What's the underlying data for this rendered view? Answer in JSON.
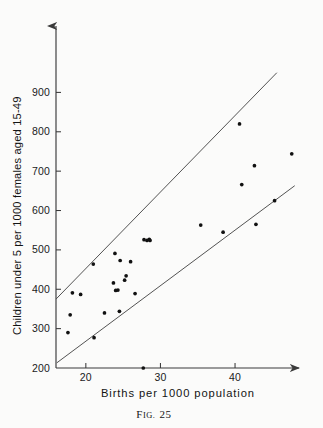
{
  "figure": {
    "caption_prefix": "F",
    "caption_small": "IG.",
    "caption_number": "25",
    "caption_full": "Fig. 25"
  },
  "chart_data": {
    "type": "scatter",
    "title": "",
    "xlabel": "Births per 1000 population",
    "ylabel": "Children under 5 per 1000 females aged 15-49",
    "xlim": [
      16,
      48.5
    ],
    "ylim": [
      200,
      950
    ],
    "xticks": [
      20,
      30,
      40
    ],
    "xtick_labels": [
      "20",
      "30",
      "40"
    ],
    "yticks": [
      200,
      300,
      400,
      500,
      600,
      700,
      800,
      900
    ],
    "ytick_labels": [
      "200",
      "300",
      "400",
      "500",
      "600",
      "700",
      "800",
      "900"
    ],
    "grid": false,
    "legend": null,
    "point_color": "#111111",
    "line_color": "#4a4a4a",
    "axis_color": "#3a3a3a",
    "x": [
      17.6,
      18.2,
      19.3,
      17.9,
      21.0,
      21.1,
      22.5,
      23.7,
      23.9,
      24.0,
      24.3,
      24.5,
      24.6,
      25.2,
      25.4,
      26.0,
      26.6,
      27.7,
      27.8,
      28.2,
      28.5,
      28.6,
      35.4,
      38.4,
      40.6,
      40.9,
      42.6,
      42.8,
      45.3,
      47.6
    ],
    "y": [
      290,
      391,
      387,
      335,
      464,
      277,
      340,
      416,
      491,
      397,
      398,
      344,
      473,
      423,
      434,
      470,
      389,
      200,
      526,
      524,
      527,
      524,
      563,
      545,
      820,
      666,
      714,
      565,
      625,
      744
    ],
    "points": [
      {
        "x": 17.6,
        "y": 290
      },
      {
        "x": 18.2,
        "y": 391
      },
      {
        "x": 19.3,
        "y": 387
      },
      {
        "x": 17.9,
        "y": 335
      },
      {
        "x": 21.0,
        "y": 464
      },
      {
        "x": 21.1,
        "y": 277
      },
      {
        "x": 22.5,
        "y": 340
      },
      {
        "x": 23.7,
        "y": 416
      },
      {
        "x": 23.9,
        "y": 491
      },
      {
        "x": 24.0,
        "y": 397
      },
      {
        "x": 24.3,
        "y": 398
      },
      {
        "x": 24.5,
        "y": 344
      },
      {
        "x": 24.6,
        "y": 473
      },
      {
        "x": 25.2,
        "y": 423
      },
      {
        "x": 25.4,
        "y": 434
      },
      {
        "x": 26.0,
        "y": 470
      },
      {
        "x": 26.6,
        "y": 389
      },
      {
        "x": 27.7,
        "y": 200
      },
      {
        "x": 27.8,
        "y": 526
      },
      {
        "x": 28.2,
        "y": 524
      },
      {
        "x": 28.5,
        "y": 527
      },
      {
        "x": 28.6,
        "y": 524
      },
      {
        "x": 35.4,
        "y": 563
      },
      {
        "x": 38.4,
        "y": 545
      },
      {
        "x": 40.6,
        "y": 820
      },
      {
        "x": 40.9,
        "y": 666
      },
      {
        "x": 42.6,
        "y": 714
      },
      {
        "x": 42.8,
        "y": 565
      },
      {
        "x": 45.3,
        "y": 625
      },
      {
        "x": 47.6,
        "y": 744
      }
    ],
    "envelope_lines": [
      {
        "name": "upper-bound",
        "x0": 16.0,
        "y0": 375,
        "x1": 45.6,
        "y1": 950
      },
      {
        "name": "lower-bound",
        "x0": 16.1,
        "y0": 213,
        "x1": 48.0,
        "y1": 663
      }
    ]
  }
}
